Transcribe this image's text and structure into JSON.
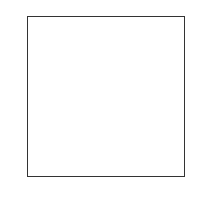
{
  "chart_data": {
    "type": "heatmap",
    "title": "",
    "xlabel": "",
    "ylabel": "",
    "colormap": "gray_r",
    "xlim": [
      -0.5,
      27.5
    ],
    "ylim": [
      27.5,
      -0.5
    ],
    "xticks": [
      0,
      5,
      10,
      15,
      20,
      25
    ],
    "yticks": [
      0,
      5,
      10,
      15,
      20,
      25
    ],
    "grid": false,
    "legend": null,
    "shape": [
      28,
      28
    ],
    "vmin": 0,
    "vmax": 255,
    "values": [
      [
        0,
        0,
        0,
        0,
        0,
        0,
        0,
        0,
        0,
        0,
        0,
        0,
        0,
        0,
        0,
        0,
        0,
        0,
        0,
        0,
        0,
        0,
        0,
        0,
        0,
        0,
        0,
        0
      ],
      [
        0,
        0,
        0,
        0,
        0,
        0,
        0,
        0,
        0,
        0,
        0,
        0,
        0,
        0,
        0,
        0,
        0,
        0,
        0,
        0,
        0,
        0,
        0,
        0,
        0,
        0,
        0,
        0
      ],
      [
        0,
        0,
        0,
        0,
        0,
        0,
        0,
        0,
        0,
        0,
        0,
        0,
        0,
        0,
        0,
        0,
        0,
        0,
        0,
        0,
        0,
        0,
        0,
        0,
        0,
        0,
        0,
        0
      ],
      [
        0,
        0,
        0,
        0,
        0,
        0,
        0,
        0,
        0,
        0,
        0,
        0,
        0,
        0,
        0,
        0,
        0,
        0,
        0,
        0,
        0,
        0,
        0,
        0,
        0,
        0,
        0,
        0
      ],
      [
        0,
        0,
        0,
        0,
        0,
        0,
        0,
        0,
        0,
        0,
        0,
        0,
        0,
        0,
        0,
        0,
        0,
        0,
        0,
        0,
        0,
        0,
        0,
        0,
        0,
        0,
        0,
        0
      ],
      [
        0,
        0,
        0,
        0,
        0,
        0,
        0,
        0,
        0,
        0,
        0,
        0,
        3,
        18,
        18,
        18,
        126,
        136,
        175,
        26,
        166,
        255,
        247,
        127,
        0,
        0,
        0,
        0
      ],
      [
        0,
        0,
        0,
        0,
        0,
        0,
        0,
        0,
        30,
        36,
        94,
        154,
        170,
        253,
        253,
        253,
        253,
        253,
        225,
        172,
        253,
        242,
        195,
        64,
        0,
        0,
        0,
        0
      ],
      [
        0,
        0,
        0,
        0,
        0,
        0,
        0,
        49,
        238,
        253,
        253,
        253,
        253,
        253,
        253,
        253,
        253,
        251,
        93,
        82,
        82,
        56,
        39,
        0,
        0,
        0,
        0,
        0
      ],
      [
        0,
        0,
        0,
        0,
        0,
        0,
        0,
        18,
        219,
        253,
        253,
        253,
        253,
        253,
        198,
        182,
        247,
        241,
        0,
        0,
        0,
        0,
        0,
        0,
        0,
        0,
        0,
        0
      ],
      [
        0,
        0,
        0,
        0,
        0,
        0,
        0,
        0,
        80,
        156,
        107,
        253,
        253,
        205,
        11,
        0,
        43,
        154,
        0,
        0,
        0,
        0,
        0,
        0,
        0,
        0,
        0,
        0
      ],
      [
        0,
        0,
        0,
        0,
        0,
        0,
        0,
        0,
        0,
        14,
        1,
        154,
        253,
        90,
        0,
        0,
        0,
        0,
        0,
        0,
        0,
        0,
        0,
        0,
        0,
        0,
        0,
        0
      ],
      [
        0,
        0,
        0,
        0,
        0,
        0,
        0,
        0,
        0,
        0,
        0,
        139,
        253,
        190,
        2,
        0,
        0,
        0,
        0,
        0,
        0,
        0,
        0,
        0,
        0,
        0,
        0,
        0
      ],
      [
        0,
        0,
        0,
        0,
        0,
        0,
        0,
        0,
        0,
        0,
        0,
        11,
        190,
        253,
        70,
        0,
        0,
        0,
        0,
        0,
        0,
        0,
        0,
        0,
        0,
        0,
        0,
        0
      ],
      [
        0,
        0,
        0,
        0,
        0,
        0,
        0,
        0,
        0,
        0,
        0,
        0,
        35,
        241,
        225,
        160,
        108,
        1,
        0,
        0,
        0,
        0,
        0,
        0,
        0,
        0,
        0,
        0
      ],
      [
        0,
        0,
        0,
        0,
        0,
        0,
        0,
        0,
        0,
        0,
        0,
        0,
        0,
        81,
        240,
        253,
        253,
        119,
        25,
        0,
        0,
        0,
        0,
        0,
        0,
        0,
        0,
        0
      ],
      [
        0,
        0,
        0,
        0,
        0,
        0,
        0,
        0,
        0,
        0,
        0,
        0,
        0,
        0,
        45,
        186,
        253,
        253,
        150,
        27,
        0,
        0,
        0,
        0,
        0,
        0,
        0,
        0
      ],
      [
        0,
        0,
        0,
        0,
        0,
        0,
        0,
        0,
        0,
        0,
        0,
        0,
        0,
        0,
        0,
        16,
        93,
        252,
        253,
        187,
        0,
        0,
        0,
        0,
        0,
        0,
        0,
        0
      ],
      [
        0,
        0,
        0,
        0,
        0,
        0,
        0,
        0,
        0,
        0,
        0,
        0,
        0,
        0,
        0,
        0,
        0,
        249,
        253,
        249,
        64,
        0,
        0,
        0,
        0,
        0,
        0,
        0
      ],
      [
        0,
        0,
        0,
        0,
        0,
        0,
        0,
        0,
        0,
        0,
        0,
        0,
        0,
        0,
        46,
        130,
        183,
        253,
        253,
        207,
        2,
        0,
        0,
        0,
        0,
        0,
        0,
        0
      ],
      [
        0,
        0,
        0,
        0,
        0,
        0,
        0,
        0,
        0,
        0,
        0,
        0,
        39,
        148,
        229,
        253,
        253,
        253,
        250,
        182,
        0,
        0,
        0,
        0,
        0,
        0,
        0,
        0
      ],
      [
        0,
        0,
        0,
        0,
        0,
        0,
        0,
        0,
        0,
        0,
        24,
        114,
        221,
        253,
        253,
        253,
        253,
        201,
        78,
        0,
        0,
        0,
        0,
        0,
        0,
        0,
        0,
        0
      ],
      [
        0,
        0,
        0,
        0,
        0,
        0,
        0,
        0,
        23,
        66,
        213,
        253,
        253,
        253,
        253,
        198,
        81,
        2,
        0,
        0,
        0,
        0,
        0,
        0,
        0,
        0,
        0,
        0
      ],
      [
        0,
        0,
        0,
        0,
        0,
        0,
        18,
        171,
        219,
        253,
        253,
        253,
        253,
        195,
        80,
        9,
        0,
        0,
        0,
        0,
        0,
        0,
        0,
        0,
        0,
        0,
        0,
        0
      ],
      [
        0,
        0,
        0,
        0,
        55,
        172,
        226,
        253,
        253,
        253,
        253,
        244,
        133,
        11,
        0,
        0,
        0,
        0,
        0,
        0,
        0,
        0,
        0,
        0,
        0,
        0,
        0,
        0
      ],
      [
        0,
        0,
        0,
        0,
        136,
        253,
        253,
        253,
        212,
        135,
        132,
        16,
        0,
        0,
        0,
        0,
        0,
        0,
        0,
        0,
        0,
        0,
        0,
        0,
        0,
        0,
        0,
        0
      ],
      [
        0,
        0,
        0,
        0,
        0,
        0,
        0,
        0,
        0,
        0,
        0,
        0,
        0,
        0,
        0,
        0,
        0,
        0,
        0,
        0,
        0,
        0,
        0,
        0,
        0,
        0,
        0,
        0
      ],
      [
        0,
        0,
        0,
        0,
        0,
        0,
        0,
        0,
        0,
        0,
        0,
        0,
        0,
        0,
        0,
        0,
        0,
        0,
        0,
        0,
        0,
        0,
        0,
        0,
        0,
        0,
        0,
        0
      ],
      [
        0,
        0,
        0,
        0,
        0,
        0,
        0,
        0,
        0,
        0,
        0,
        0,
        0,
        0,
        0,
        0,
        0,
        0,
        0,
        0,
        0,
        0,
        0,
        0,
        0,
        0,
        0,
        0
      ]
    ]
  },
  "axes": {
    "xtick_labels": [
      "0",
      "5",
      "10",
      "15",
      "20",
      "25"
    ],
    "ytick_labels": [
      "0",
      "5",
      "10",
      "15",
      "20",
      "25"
    ],
    "frame_color": "#333333",
    "tick_color": "#333333"
  }
}
